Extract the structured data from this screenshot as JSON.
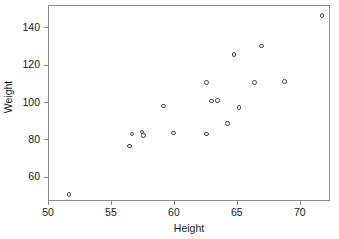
{
  "chart_data": {
    "type": "scatter",
    "title": "",
    "xlabel": "Height",
    "ylabel": "Weight",
    "xlim": [
      50.0,
      72.4
    ],
    "ylim": [
      47.0,
      152.0
    ],
    "grid": false,
    "legend": null,
    "xticks": [
      50,
      55,
      60,
      65,
      70
    ],
    "xtick_labels": [
      "50",
      "55",
      "60",
      "65",
      "70"
    ],
    "yticks": [
      60,
      80,
      100,
      120,
      140
    ],
    "ytick_labels": [
      "60",
      "80",
      "100",
      "120",
      "140"
    ],
    "marker": "open-circle",
    "marker_color": "#4a4a4a",
    "points": [
      {
        "x": 51.6,
        "y": 51.0
      },
      {
        "x": 56.4,
        "y": 77.0
      },
      {
        "x": 56.6,
        "y": 83.5
      },
      {
        "x": 57.4,
        "y": 84.5
      },
      {
        "x": 57.5,
        "y": 82.5
      },
      {
        "x": 59.1,
        "y": 98.5
      },
      {
        "x": 59.9,
        "y": 84.0
      },
      {
        "x": 62.5,
        "y": 111.0
      },
      {
        "x": 62.5,
        "y": 83.5
      },
      {
        "x": 62.9,
        "y": 101.0
      },
      {
        "x": 63.4,
        "y": 101.5
      },
      {
        "x": 64.2,
        "y": 89.0
      },
      {
        "x": 64.7,
        "y": 126.0
      },
      {
        "x": 65.1,
        "y": 97.5
      },
      {
        "x": 66.3,
        "y": 111.0
      },
      {
        "x": 66.9,
        "y": 130.5
      },
      {
        "x": 68.7,
        "y": 111.5
      },
      {
        "x": 71.7,
        "y": 147.0
      }
    ]
  }
}
